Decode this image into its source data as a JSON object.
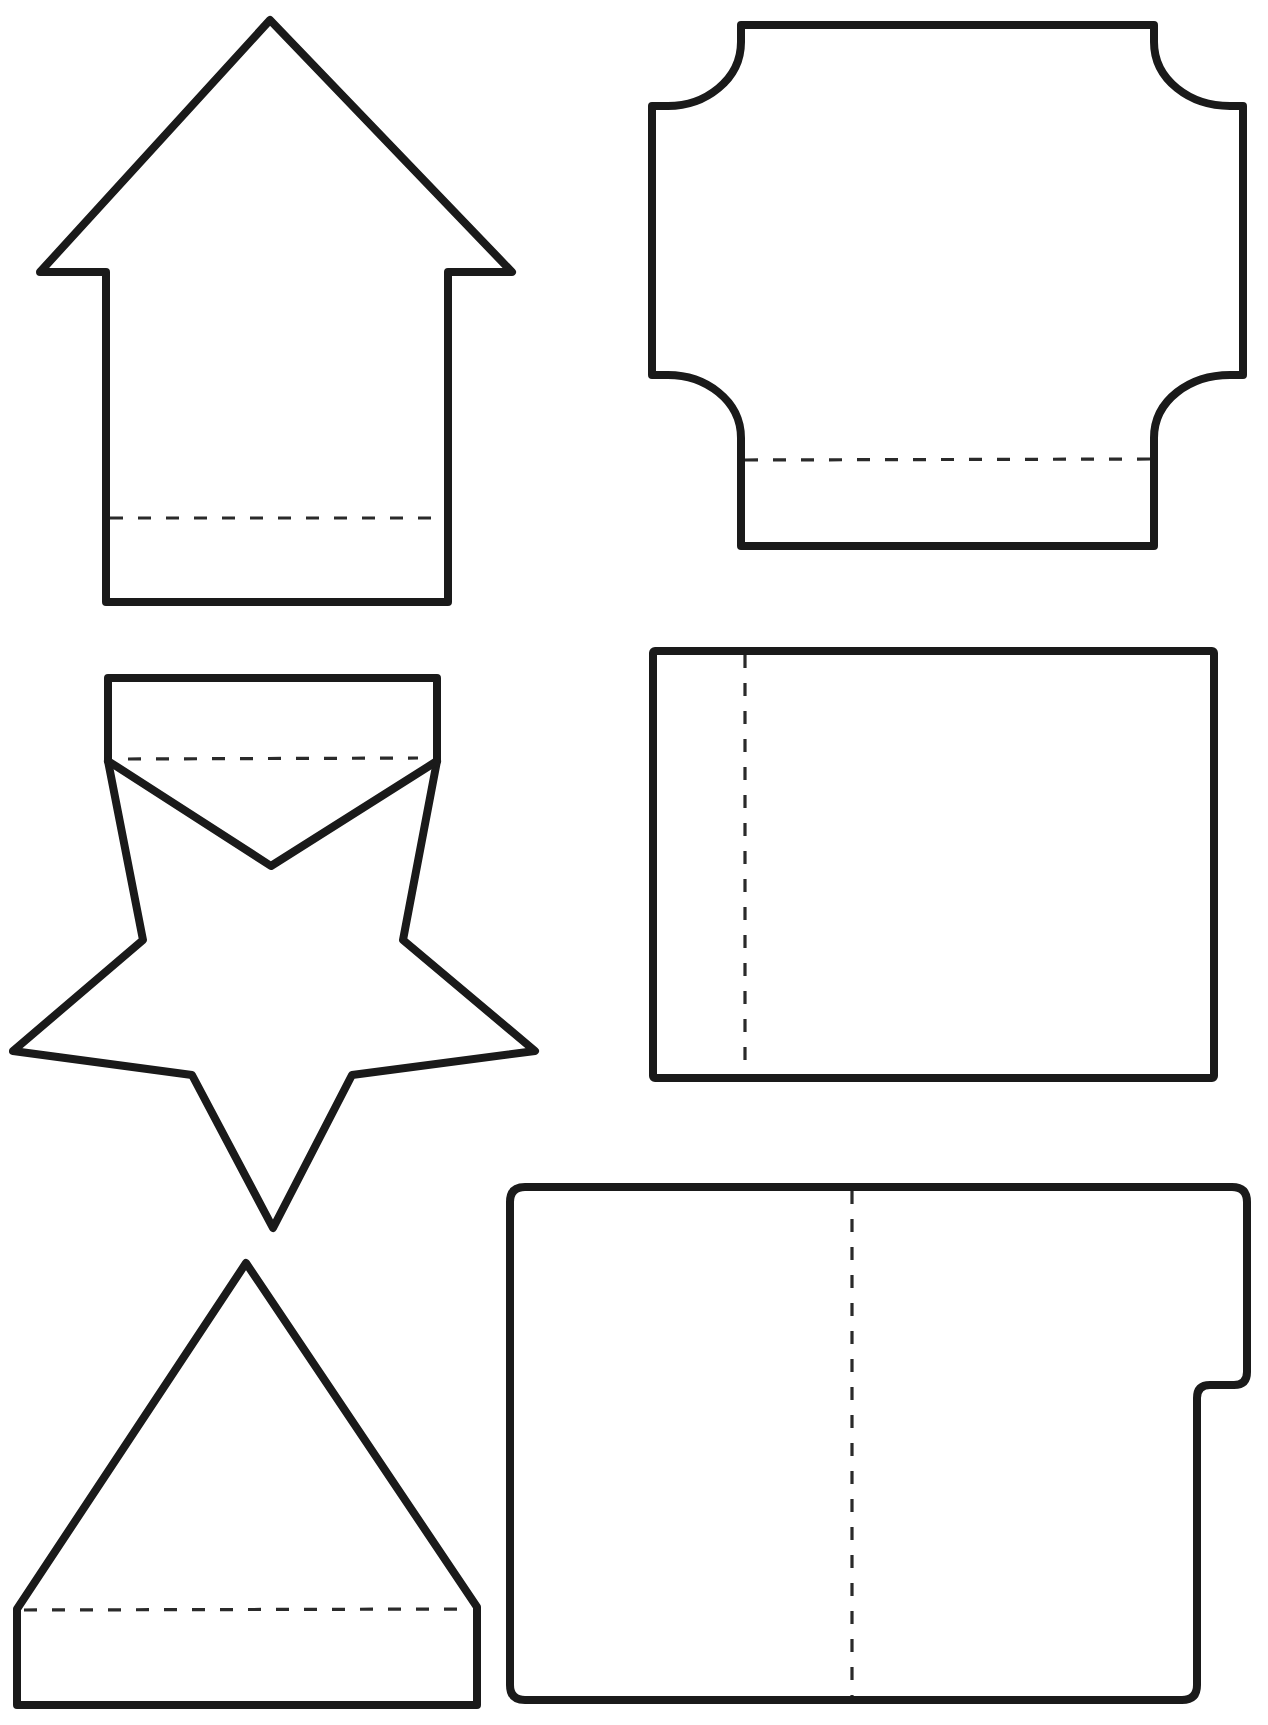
{
  "page": {
    "title": "",
    "background": "#ffffff",
    "outline_color": "#1a1a1a",
    "fold_line_color": "#2a2a2a"
  },
  "shapes": [
    {
      "id": "house",
      "label": "house-shaped card",
      "cut_line": "solid",
      "fold_line": "horizontal dashed near bottom"
    },
    {
      "id": "plaque",
      "label": "notched-corner plaque card",
      "cut_line": "solid",
      "fold_line": "horizontal dashed near bottom"
    },
    {
      "id": "star",
      "label": "star card with top tab",
      "cut_line": "solid",
      "fold_line": "horizontal dashed at tab base"
    },
    {
      "id": "rectangle",
      "label": "rectangle card",
      "cut_line": "solid",
      "fold_line": "vertical dashed near left edge"
    },
    {
      "id": "triangle",
      "label": "triangle card with base tab",
      "cut_line": "solid",
      "fold_line": "horizontal dashed at tab top"
    },
    {
      "id": "folder",
      "label": "file-folder card with side tab",
      "cut_line": "solid",
      "fold_line": "vertical dashed at center"
    }
  ]
}
